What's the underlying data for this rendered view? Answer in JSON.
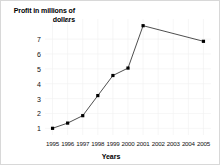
{
  "chart_data": {
    "type": "line",
    "title": "",
    "xlabel": "Years",
    "ylabel": "Profit in millions of dollars",
    "categories": [
      "1995",
      "1996",
      "1997",
      "1998",
      "1999",
      "2000",
      "2001",
      "2002",
      "2003",
      "2004",
      "2005"
    ],
    "x": [
      1995,
      1996,
      1997,
      1998,
      1999,
      2000,
      2001,
      2002,
      2003,
      2004,
      2005
    ],
    "values": [
      1.0,
      1.35,
      1.85,
      3.2,
      4.55,
      5.05,
      7.9,
      null,
      null,
      null,
      6.85
    ],
    "marked_points": [
      {
        "x": "1995",
        "y": 1.0
      },
      {
        "x": "1996",
        "y": 1.35
      },
      {
        "x": "1997",
        "y": 1.85
      },
      {
        "x": "1998",
        "y": 3.2
      },
      {
        "x": "1999",
        "y": 4.55
      },
      {
        "x": "2000",
        "y": 5.05
      },
      {
        "x": "2001",
        "y": 7.9
      },
      {
        "x": "2005",
        "y": 6.85
      }
    ],
    "ytick_labels": [
      "1",
      "2",
      "3",
      "4",
      "5",
      "6",
      "7"
    ],
    "ytick_values": [
      1,
      2,
      3,
      4,
      5,
      6,
      7
    ],
    "xtick_labels": [
      "1995",
      "1996",
      "1997",
      "1998",
      "1999",
      "2000",
      "2001",
      "2002",
      "2003",
      "2004",
      "2005"
    ],
    "ylim": [
      0.55,
      8.35
    ],
    "xlim": [
      1994.5,
      2005.5
    ],
    "grid": true,
    "legend": false,
    "marker": "square",
    "series_color": "#000000",
    "line_color": "#3a3a3a",
    "background_color": "#ffffff",
    "border_color": "#d8d8d8"
  },
  "axis": {
    "y_title": "Profit in millions of dollars",
    "x_title": "Years"
  }
}
